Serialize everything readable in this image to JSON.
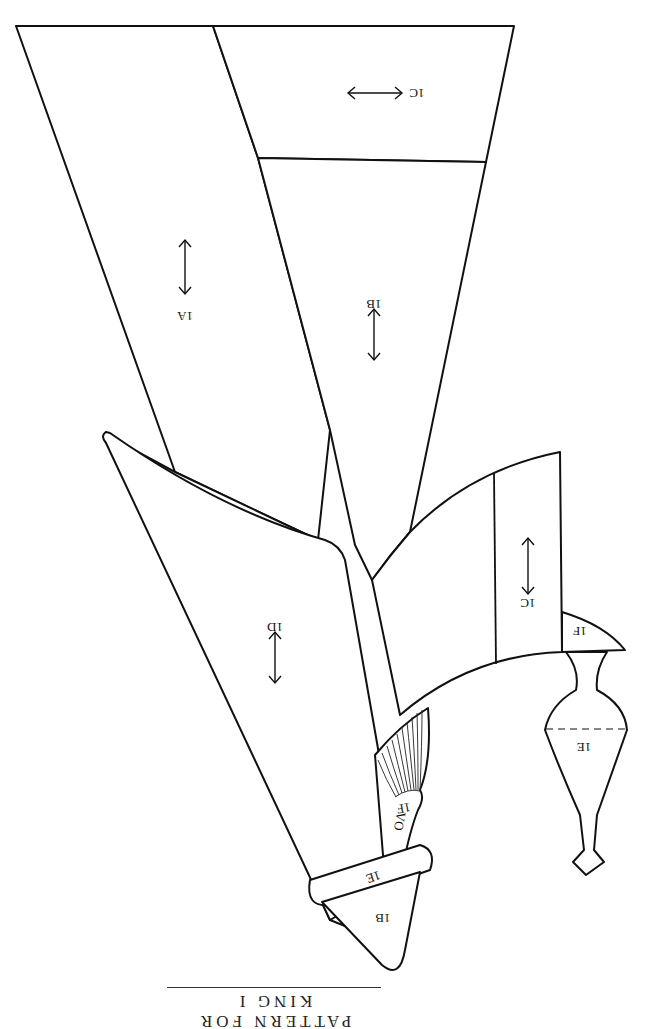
{
  "title": "PATTERN FOR KING I",
  "orientation": "rotated 180 degrees (upside-down scan)",
  "pieces": [
    {
      "id": "1A",
      "label": "1A",
      "grainline": "vertical"
    },
    {
      "id": "1B-upper",
      "label": "1B",
      "grainline": "vertical"
    },
    {
      "id": "1C-upper",
      "label": "1C",
      "grainline": "horizontal"
    },
    {
      "id": "1D",
      "label": "1D",
      "grainline": "vertical"
    },
    {
      "id": "1C-lower",
      "label": "1C",
      "grainline": "vertical"
    },
    {
      "id": "1F-right",
      "label": "1F"
    },
    {
      "id": "1E-pommel",
      "label": "1E"
    },
    {
      "id": "1F-hilt",
      "label": "1F",
      "extra_mark": "OΛ"
    },
    {
      "id": "1E-band",
      "label": "1E"
    },
    {
      "id": "1B-tip",
      "label": "1B"
    }
  ],
  "colors": {
    "line": "#111111",
    "background": "#ffffff"
  }
}
